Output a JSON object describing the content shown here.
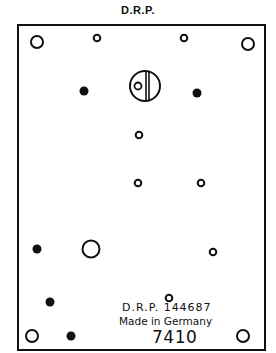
{
  "header": {
    "title": "D.R.P."
  },
  "plate": {
    "border_color": "#111111",
    "patent_text": "D.R.P. 144687",
    "origin_text": "Made in Germany",
    "model_number": "7410"
  },
  "holes": {
    "corner_open": [
      [
        37,
        42
      ],
      [
        248,
        44
      ],
      [
        32,
        336
      ],
      [
        243,
        336
      ]
    ],
    "small_open": [
      [
        97,
        38
      ],
      [
        184,
        38
      ],
      [
        139,
        135
      ],
      [
        138,
        183
      ],
      [
        201,
        183
      ],
      [
        213,
        252
      ],
      [
        169,
        298
      ]
    ],
    "filled": [
      [
        84,
        91
      ],
      [
        197,
        93
      ],
      [
        37,
        249
      ],
      [
        50,
        302
      ],
      [
        71,
        336
      ]
    ],
    "large_open": [
      [
        91,
        249
      ]
    ],
    "slotted_screw": {
      "center": [
        145,
        86
      ],
      "radius": 15
    }
  }
}
